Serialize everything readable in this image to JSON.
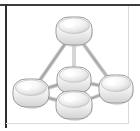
{
  "frame": {
    "width": 140,
    "height": 131,
    "background_color": "#ffffff",
    "border_top_color": "#3c3c3c",
    "border_left_color": "#2e2e2e",
    "border_right_color": "#d9d9d9",
    "border_bottom_color": "#dcdcdc"
  },
  "diagram": {
    "type": "3d-node-graph",
    "node_fill_light": "#ffffff",
    "node_fill_mid": "#ededed",
    "node_fill_shadow": "#c6c6c6",
    "node_stroke_color": "#9a9a9a",
    "edge_color": "#b0b0b0",
    "edge_highlight_color": "#d6d6d6",
    "edge_width": 2.4,
    "nodes": [
      {
        "id": "apex",
        "label": "Apex node",
        "cx": 74,
        "cy": 31,
        "rx": 18,
        "ry": 14
      },
      {
        "id": "center",
        "label": "Center node",
        "cx": 74,
        "cy": 80,
        "rx": 17,
        "ry": 13
      },
      {
        "id": "bottom-front",
        "label": "Bottom front node",
        "cx": 74,
        "cy": 105,
        "rx": 18,
        "ry": 14
      },
      {
        "id": "left",
        "label": "Left node",
        "cx": 31,
        "cy": 93,
        "rx": 18,
        "ry": 14
      },
      {
        "id": "right",
        "label": "Right node",
        "cx": 116,
        "cy": 89,
        "rx": 17,
        "ry": 14
      }
    ],
    "edges": [
      {
        "id": "apex-left",
        "from": "apex",
        "to": "left",
        "label": "apex to left"
      },
      {
        "id": "apex-right",
        "from": "apex",
        "to": "right",
        "label": "apex to right"
      },
      {
        "id": "apex-center",
        "from": "apex",
        "to": "center",
        "label": "apex to center"
      },
      {
        "id": "apex-bottom-front",
        "from": "apex",
        "to": "bottom-front",
        "label": "apex to bottom front"
      },
      {
        "id": "left-center",
        "from": "left",
        "to": "center",
        "label": "left to center"
      },
      {
        "id": "center-right",
        "from": "center",
        "to": "right",
        "label": "center to right"
      },
      {
        "id": "left-bottom-front",
        "from": "left",
        "to": "bottom-front",
        "label": "left to bottom front"
      },
      {
        "id": "bottom-front-right",
        "from": "bottom-front",
        "to": "right",
        "label": "bottom front to right"
      },
      {
        "id": "center-bottom-front",
        "from": "center",
        "to": "bottom-front",
        "label": "center to bottom front"
      }
    ]
  }
}
